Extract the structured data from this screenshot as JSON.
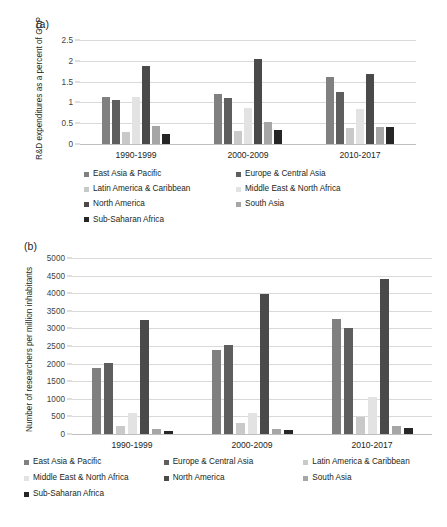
{
  "figure": {
    "panel_a_tag": "(a)",
    "panel_b_tag": "(b)"
  },
  "series_colors": {
    "East Asia & Pacific": "#808080",
    "Europe & Central Asia": "#5e5e5e",
    "Latin America & Caribbean": "#c9c9c9",
    "Middle East & North Africa": "#e3e3e3",
    "North America": "#4a4a4a",
    "South Asia": "#a6a6a6",
    "Sub-Saharan Africa": "#262626"
  },
  "chart_data": [
    {
      "id": "chart-a",
      "type": "bar",
      "title": "",
      "panel_label": "(a)",
      "xlabel": "",
      "ylabel": "R&D expenditures as a percent of GDP",
      "categories": [
        "1990-1999",
        "2000-2009",
        "2010-2017"
      ],
      "ylim": [
        0,
        2.5
      ],
      "yticks": [
        0,
        0.5,
        1,
        1.5,
        2,
        2.5
      ],
      "ytick_labels": [
        "0",
        "0.5",
        "1",
        "1.5",
        "2",
        "2.5"
      ],
      "grid": true,
      "legend_position": "bottom",
      "legend_columns": 2,
      "series": [
        {
          "name": "East Asia & Pacific",
          "values": [
            1.12,
            1.2,
            1.6
          ]
        },
        {
          "name": "Europe & Central Asia",
          "values": [
            1.06,
            1.1,
            1.25
          ]
        },
        {
          "name": "Latin America & Caribbean",
          "values": [
            0.28,
            0.32,
            0.39
          ]
        },
        {
          "name": "Middle East & North Africa",
          "values": [
            1.12,
            0.86,
            0.85
          ]
        },
        {
          "name": "North America",
          "values": [
            1.88,
            2.04,
            1.68
          ]
        },
        {
          "name": "South Asia",
          "values": [
            0.44,
            0.53,
            0.42
          ]
        },
        {
          "name": "Sub-Saharan Africa",
          "values": [
            0.25,
            0.34,
            0.4
          ]
        }
      ]
    },
    {
      "id": "chart-b",
      "type": "bar",
      "title": "",
      "panel_label": "(b)",
      "xlabel": "",
      "ylabel": "Number of researchers per million inhabitants",
      "categories": [
        "1990-1999",
        "2000-2009",
        "2010-2017"
      ],
      "ylim": [
        0,
        5000
      ],
      "yticks": [
        0,
        500,
        1000,
        1500,
        2000,
        2500,
        3000,
        3500,
        4000,
        4500,
        5000
      ],
      "ytick_labels": [
        "0",
        "500",
        "1000",
        "1500",
        "2000",
        "2500",
        "3000",
        "3500",
        "4000",
        "4500",
        "5000"
      ],
      "grid": true,
      "legend_position": "bottom",
      "legend_columns": 3,
      "series": [
        {
          "name": "East Asia & Pacific",
          "values": [
            1870,
            2380,
            3270
          ]
        },
        {
          "name": "Europe & Central Asia",
          "values": [
            2020,
            2530,
            3000
          ]
        },
        {
          "name": "Latin America & Caribbean",
          "values": [
            215,
            310,
            470
          ]
        },
        {
          "name": "Middle East & North Africa",
          "values": [
            590,
            610,
            1060
          ]
        },
        {
          "name": "North America",
          "values": [
            3240,
            3970,
            4400
          ]
        },
        {
          "name": "South Asia",
          "values": [
            140,
            140,
            220
          ]
        },
        {
          "name": "Sub-Saharan Africa",
          "values": [
            80,
            125,
            165
          ]
        }
      ]
    }
  ]
}
